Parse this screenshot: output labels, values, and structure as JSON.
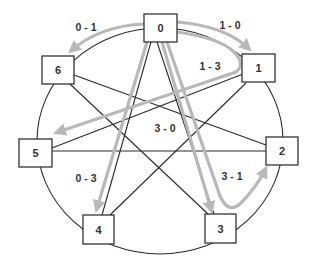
{
  "diagram": {
    "type": "ring-with-chords",
    "colors": {
      "node_stroke": "#333333",
      "edge": "#2a2a2a",
      "message_path": "#b8b8b8",
      "background": "#ffffff"
    },
    "nodes": [
      {
        "id": "0",
        "label": "0",
        "x": 160,
        "y": 28
      },
      {
        "id": "1",
        "label": "1",
        "x": 258,
        "y": 69
      },
      {
        "id": "2",
        "label": "2",
        "x": 281,
        "y": 152
      },
      {
        "id": "3",
        "label": "3",
        "x": 220,
        "y": 229
      },
      {
        "id": "4",
        "label": "4",
        "x": 98,
        "y": 230
      },
      {
        "id": "5",
        "label": "5",
        "x": 35,
        "y": 153
      },
      {
        "id": "6",
        "label": "6",
        "x": 58,
        "y": 71
      }
    ],
    "chords": [
      [
        "0",
        "3"
      ],
      [
        "0",
        "4"
      ],
      [
        "1",
        "5"
      ],
      [
        "1",
        "4"
      ],
      [
        "6",
        "2"
      ],
      [
        "6",
        "3"
      ],
      [
        "5",
        "2"
      ]
    ],
    "messages": [
      {
        "label": "0 - 1",
        "from": "0",
        "to": "6"
      },
      {
        "label": "1 - 0",
        "from": "0",
        "to": "1"
      },
      {
        "label": "1 - 3",
        "from": "0",
        "to": "5"
      },
      {
        "label": "3 - 0",
        "from": "0",
        "to": "3"
      },
      {
        "label": "0 - 3",
        "from": "0",
        "to": "4"
      },
      {
        "label": "3 - 1",
        "from": "0",
        "to": "2"
      }
    ]
  }
}
